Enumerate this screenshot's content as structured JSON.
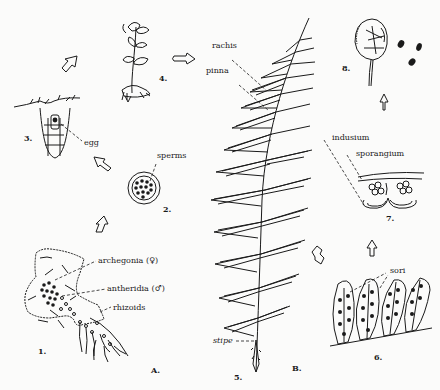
{
  "diagram": {
    "panels": {
      "A": {
        "label": "A."
      },
      "B": {
        "label": "B."
      }
    },
    "stages": [
      {
        "number": "1.",
        "name": "prothallus",
        "labels": [
          "archegonia (♀)",
          "antheridia (♂)",
          "rhizoids"
        ]
      },
      {
        "number": "2.",
        "name": "antheridium",
        "labels": [
          "sperms"
        ]
      },
      {
        "number": "3.",
        "name": "archegonium",
        "labels": [
          "egg"
        ]
      },
      {
        "number": "4.",
        "name": "young sporophyte",
        "labels": []
      },
      {
        "number": "5.",
        "name": "frond",
        "labels": [
          "rachis",
          "pinna",
          "stipe"
        ]
      },
      {
        "number": "6.",
        "name": "pinnules with sori",
        "labels": [
          "sori"
        ]
      },
      {
        "number": "7.",
        "name": "sorus cross-section",
        "labels": [
          "indusium",
          "sporangium"
        ]
      },
      {
        "number": "8.",
        "name": "sporangium releasing spores",
        "labels": []
      }
    ],
    "arrows": [
      {
        "from": "1",
        "to": "2"
      },
      {
        "from": "2",
        "to": "3"
      },
      {
        "from": "3",
        "to": "4"
      },
      {
        "from": "4",
        "to": "5"
      },
      {
        "from": "5",
        "to": "6"
      },
      {
        "from": "6",
        "to": "7"
      },
      {
        "from": "7",
        "to": "8"
      }
    ],
    "colors": {
      "ink": "#1a1a1a",
      "paper": "#fbfbfa"
    }
  }
}
